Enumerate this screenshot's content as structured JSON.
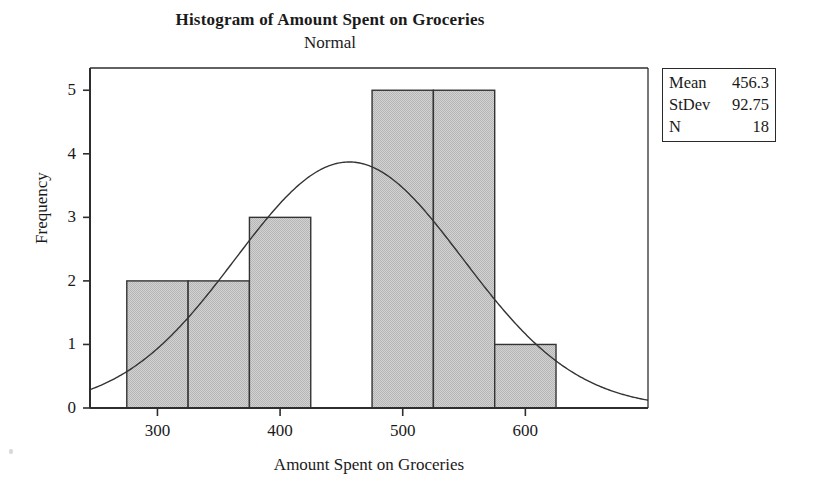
{
  "chart_data": {
    "type": "bar",
    "title": "Histogram of Amount Spent on Groceries",
    "subtitle": "Normal",
    "xlabel": "Amount Spent on Groceries",
    "ylabel": "Frequency",
    "xlim": [
      245,
      700
    ],
    "ylim": [
      0,
      5.35
    ],
    "xticks": [
      300,
      400,
      500,
      600
    ],
    "xtick_labels": [
      "300",
      "400",
      "500",
      "600"
    ],
    "yticks": [
      0,
      1,
      2,
      3,
      4,
      5
    ],
    "ytick_labels": [
      "0",
      "1",
      "2",
      "3",
      "4",
      "5"
    ],
    "grid": false,
    "legend_position": "outside-top-right",
    "bin_width": 50,
    "bin_edges": [
      275,
      325,
      375,
      425,
      475,
      525,
      575,
      625
    ],
    "categories": [
      "275-325",
      "325-375",
      "375-425",
      "425-475",
      "475-525",
      "525-575",
      "575-625"
    ],
    "values": [
      2,
      2,
      3,
      0,
      5,
      5,
      1
    ],
    "bar_fill_color": "#c9c9c9",
    "bar_edge_color": "#333333",
    "curve_color": "#333333",
    "overlay": {
      "name": "Normal",
      "type": "line",
      "distribution": "normal",
      "mean": 456.3,
      "stdev": 92.75,
      "n": 18,
      "scale_note": "N * bin_width * pdf(x)"
    }
  },
  "legend": {
    "rows": [
      {
        "key": "Mean",
        "value": "456.3"
      },
      {
        "key": "StDev",
        "value": "92.75"
      },
      {
        "key": "N",
        "value": "18"
      }
    ]
  }
}
